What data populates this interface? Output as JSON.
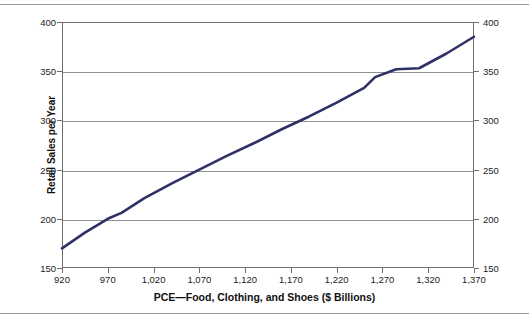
{
  "chart_data": {
    "type": "line",
    "title": "",
    "xlabel": "PCE—Food, Clothing, and Shoes ($ Billions)",
    "ylabel": "Retail Sales per Year",
    "xlim": [
      920,
      1370
    ],
    "ylim": [
      150,
      400
    ],
    "grid": true,
    "legend": null,
    "line_color": "#2e3166",
    "x_ticks": [
      "920",
      "970",
      "1,020",
      "1,070",
      "1,120",
      "1,170",
      "1,220",
      "1,270",
      "1,320",
      "1,370"
    ],
    "x_tick_values": [
      920,
      970,
      1020,
      1070,
      1120,
      1170,
      1220,
      1270,
      1320,
      1370
    ],
    "y_ticks_left": [
      "400",
      "350",
      "300",
      "250",
      "200",
      "150"
    ],
    "y_ticks_right": [
      "400",
      "350",
      "300",
      "250",
      "200",
      "150"
    ],
    "y_tick_values": [
      400,
      350,
      300,
      250,
      200,
      150
    ],
    "series": [
      {
        "name": "Retail Sales per Year",
        "x": [
          920,
          945,
          970,
          985,
          1010,
          1040,
          1070,
          1100,
          1130,
          1160,
          1190,
          1220,
          1250,
          1262,
          1285,
          1310,
          1340,
          1370
        ],
        "y": [
          170,
          186,
          200,
          206,
          221,
          236,
          250,
          264,
          277,
          291,
          304,
          318,
          333,
          344,
          352,
          353,
          368,
          385
        ]
      }
    ]
  },
  "axes": {
    "y_axis_title": "Retail Sales per Year",
    "x_axis_title": "PCE—Food, Clothing, and Shoes ($ Billions)"
  }
}
